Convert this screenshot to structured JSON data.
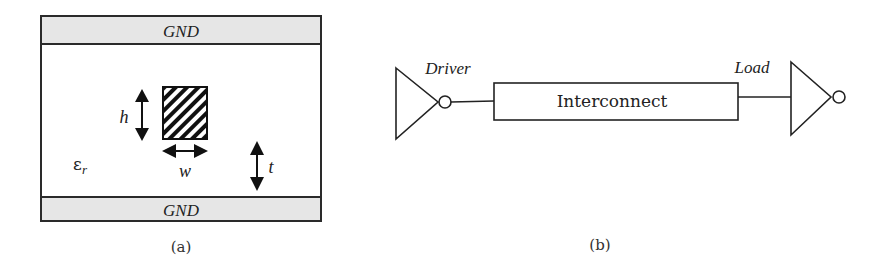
{
  "figure": {
    "panel_a": {
      "caption": "(a)",
      "top_plane_label": "GND",
      "bottom_plane_label": "GND",
      "dielectric_label": "ε",
      "dielectric_subscript": "r",
      "height_label": "h",
      "width_label": "w",
      "thickness_label": "t",
      "colors": {
        "ground_fill": "#e6e6e6",
        "stroke": "#2a2a2a"
      }
    },
    "panel_b": {
      "caption": "(b)",
      "driver_label": "Driver",
      "interconnect_label": "Interconnect",
      "load_label": "Load"
    }
  }
}
